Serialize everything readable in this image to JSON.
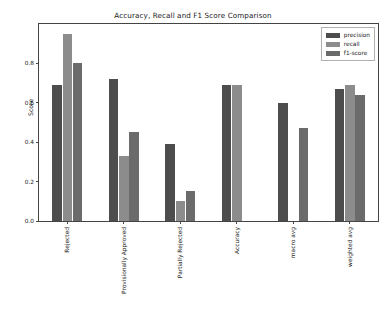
{
  "chart_data": {
    "type": "bar",
    "title": "Accuracy, Recall and F1 Score Comparison",
    "xlabel": "",
    "ylabel": "Score",
    "categories": [
      "Rejected",
      "Provisionally Approved",
      "Partially Rejected",
      "Accuracy",
      "macro avg",
      "weighted avg"
    ],
    "series": [
      {
        "name": "precision",
        "color": "#4d4d4d",
        "values": [
          0.69,
          0.72,
          0.39,
          0.69,
          0.6,
          0.67
        ]
      },
      {
        "name": "recall",
        "color": "#8c8c8c",
        "values": [
          0.95,
          0.33,
          0.1,
          0.69,
          null,
          0.69
        ]
      },
      {
        "name": "f1-score",
        "color": "#6b6b6b",
        "values": [
          0.8,
          0.45,
          0.15,
          null,
          0.47,
          0.64
        ]
      }
    ],
    "ylim": [
      0.0,
      1.0
    ],
    "yticks": [
      0.0,
      0.2,
      0.4,
      0.6,
      0.8
    ],
    "ytick_labels": [
      "0.0",
      "0.2",
      "0.4",
      "0.6",
      "0.8"
    ],
    "grid": false,
    "legend_position": "upper right",
    "legend_entries": [
      "precision",
      "recall",
      "f1-score"
    ]
  },
  "legend": {
    "items": [
      {
        "label": "precision"
      },
      {
        "label": "recall"
      },
      {
        "label": "f1-score"
      }
    ]
  }
}
